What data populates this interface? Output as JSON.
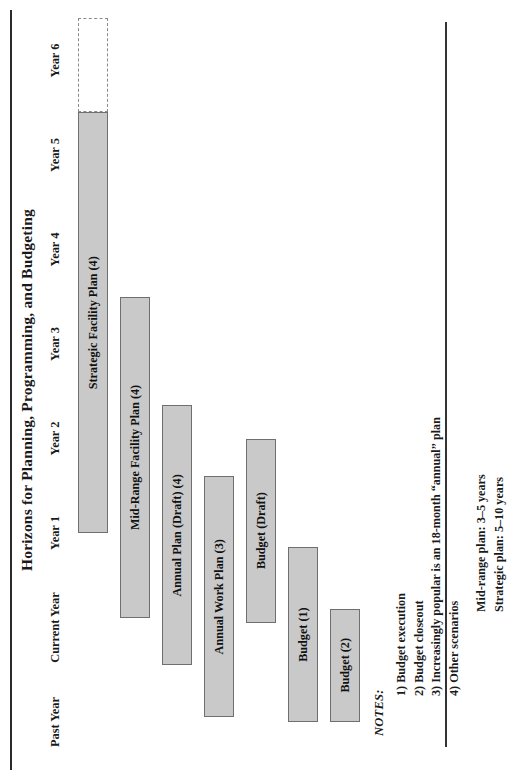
{
  "figure": {
    "title": "Horizons for Planning, Programming, and Budgeting",
    "bar_fill": "#c9c9c9",
    "bar_stroke": "#6f6f6f",
    "dashed_stroke": "#8a8a8a",
    "rule_color": "#2b2b2b"
  },
  "chart_data": {
    "type": "bar",
    "title": "Horizons for Planning, Programming, and Budgeting",
    "xlabel": "",
    "ylabel": "",
    "orientation": "gantt-horizontal",
    "grid": false,
    "legend": "none",
    "categories": [
      "Past Year",
      "Current Year",
      "Year 1",
      "Year 2",
      "Year 3",
      "Year 4",
      "Year 5",
      "Year 6"
    ],
    "axis_ticks": [
      {
        "label": "Past Year",
        "index": 0
      },
      {
        "label": "Current Year",
        "index": 1
      },
      {
        "label": "Year 1",
        "index": 2
      },
      {
        "label": "Year 2",
        "index": 3
      },
      {
        "label": "Year 3",
        "index": 4
      },
      {
        "label": "Year 4",
        "index": 5
      },
      {
        "label": "Year 5",
        "index": 6
      },
      {
        "label": "Year 6",
        "index": 7
      }
    ],
    "series": [
      {
        "name": "Strategic Facility Plan (4)",
        "label": "Strategic Facility Plan (4)",
        "start_year": "Year 1",
        "end_year": "Year 5",
        "start_index": 2.0,
        "end_index": 6.45,
        "row": 0,
        "style": "solid"
      },
      {
        "name": "Strategic Facility Plan (4) extension",
        "label": "",
        "start_year": "Year 5",
        "end_year": "Year 6",
        "start_index": 6.45,
        "end_index": 7.45,
        "row": 0,
        "style": "dashed"
      },
      {
        "name": "Mid-Range Facility Plan (4)",
        "label": "Mid-Range Facility Plan (4)",
        "start_year": "Current Year",
        "end_year": "Year 3",
        "start_index": 1.1,
        "end_index": 4.5,
        "row": 1,
        "style": "solid"
      },
      {
        "name": "Annual Plan (Draft) (4)",
        "label": "Annual Plan (Draft) (4)",
        "start_year": "Current Year",
        "end_year": "Year 2",
        "start_index": 0.6,
        "end_index": 3.35,
        "row": 2,
        "style": "solid"
      },
      {
        "name": "Annual Work Plan (3)",
        "label": "Annual Work Plan (3)",
        "start_year": "Past Year",
        "end_year": "Year 1",
        "start_index": 0.05,
        "end_index": 2.6,
        "row": 3,
        "style": "solid"
      },
      {
        "name": "Budget (Draft)",
        "label": "Budget (Draft)",
        "start_year": "Current Year",
        "end_year": "Year 2",
        "start_index": 1.05,
        "end_index": 3.0,
        "row": 4,
        "style": "solid"
      },
      {
        "name": "Budget (1)",
        "label": "Budget (1)",
        "start_year": "Past Year",
        "end_year": "Current Year",
        "start_index": 0.0,
        "end_index": 1.85,
        "row": 5,
        "style": "solid"
      },
      {
        "name": "Budget (2)",
        "label": "Budget (2)",
        "start_year": "Past Year",
        "end_year": "Current Year",
        "start_index": 0.0,
        "end_index": 1.2,
        "row": 6,
        "style": "solid"
      }
    ]
  },
  "notes": {
    "heading": "NOTES:",
    "items": [
      "1) Budget execution",
      "2) Budget closeout",
      "3) Increasingly popular is an 18-month “annual” plan",
      "4) Other scenarios"
    ],
    "scenarios": [
      "Mid-range plan: 3–5 years",
      "Strategic plan:  5–10 years"
    ]
  }
}
